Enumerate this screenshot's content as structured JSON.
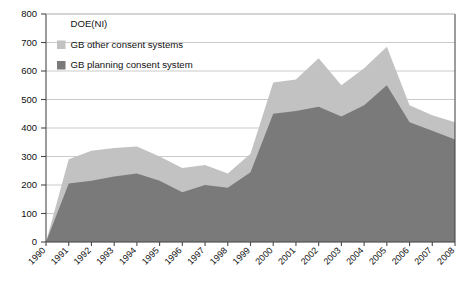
{
  "chart_data": {
    "type": "area",
    "stacked": true,
    "title": "",
    "xlabel": "",
    "ylabel": "",
    "ylim": [
      0,
      800
    ],
    "ytick_step": 100,
    "grid": true,
    "legend_position": "top-left",
    "categories": [
      "1990",
      "1991",
      "1992",
      "1993",
      "1994",
      "1995",
      "1996",
      "1997",
      "1998",
      "1999",
      "2000",
      "2001",
      "2002",
      "2003",
      "2004",
      "2005",
      "2006",
      "2007",
      "2008"
    ],
    "yticks": [
      "0",
      "100",
      "200",
      "300",
      "400",
      "500",
      "600",
      "700",
      "800"
    ],
    "series": [
      {
        "name": "GB planning consent system",
        "color": "#7a7a7a",
        "values": [
          0,
          205,
          215,
          230,
          240,
          215,
          175,
          200,
          190,
          245,
          450,
          460,
          475,
          440,
          480,
          550,
          420,
          390,
          360
        ]
      },
      {
        "name": "GB other consent systems",
        "color": "#c2c2c2",
        "values": [
          0,
          85,
          105,
          100,
          95,
          85,
          85,
          70,
          50,
          65,
          110,
          110,
          170,
          110,
          130,
          135,
          60,
          55,
          60
        ]
      },
      {
        "name": "DOE(NI)",
        "color": "#ffffff",
        "values": [
          0,
          0,
          0,
          0,
          0,
          0,
          0,
          0,
          0,
          0,
          0,
          0,
          0,
          0,
          0,
          0,
          0,
          0,
          0
        ]
      }
    ],
    "totals": [
      0,
      290,
      320,
      330,
      335,
      300,
      260,
      270,
      240,
      310,
      560,
      570,
      645,
      550,
      610,
      685,
      480,
      445,
      420
    ],
    "legend": [
      {
        "label": "DOE(NI)",
        "swatch": "#ffffff"
      },
      {
        "label": "GB other consent systems",
        "swatch": "#c2c2c2"
      },
      {
        "label": "GB planning consent system",
        "swatch": "#7a7a7a"
      }
    ]
  }
}
